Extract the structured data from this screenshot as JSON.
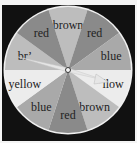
{
  "spinner": {
    "center": [
      68,
      70
    ],
    "radius": 63,
    "start_angle_deg": -108,
    "sectors": [
      {
        "label": "brown",
        "fill": "#bdbdbd"
      },
      {
        "label": "red",
        "fill": "#8a8a8a"
      },
      {
        "label": "blue",
        "fill": "#a9a9a9"
      },
      {
        "label": "yellow",
        "fill": "#ececec"
      },
      {
        "label": "brown",
        "fill": "#bdbdbd"
      },
      {
        "label": "red",
        "fill": "#8a8a8a"
      },
      {
        "label": "blue",
        "fill": "#a9a9a9"
      },
      {
        "label": "yellow",
        "fill": "#ececec"
      },
      {
        "label": "brown",
        "fill": "#bdbdbd"
      },
      {
        "label": "red",
        "fill": "#8a8a8a"
      }
    ],
    "visible_labels": [
      "brown",
      "red",
      "blue",
      "’llow",
      "brown",
      "red",
      "blue",
      "yellow",
      "br’",
      "red"
    ],
    "rim_color": "#f0f0f0",
    "background_color": "#111111",
    "arrow": {
      "pointing_to": "yellow",
      "color": "#e6e6e6"
    }
  }
}
